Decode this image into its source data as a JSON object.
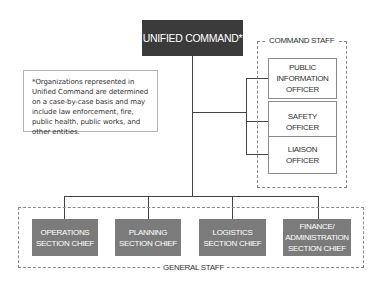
{
  "diagram": {
    "top": {
      "label": "UNIFIED COMMAND*"
    },
    "footnote": "*Organizations represented in Unified Command are determined on a case-by-case basis and may include law enforcement, fire, public health, public works, and other entities.",
    "command_staff": {
      "label": "COMMAND STAFF",
      "officers": [
        {
          "label": "PUBLIC\nINFORMATION\nOFFICER"
        },
        {
          "label": "SAFETY\nOFFICER"
        },
        {
          "label": "LIAISON\nOFFICER"
        }
      ]
    },
    "general_staff": {
      "label": "GENERAL STAFF",
      "chiefs": [
        {
          "label": "OPERATIONS\nSECTION CHIEF"
        },
        {
          "label": "PLANNING\nSECTION CHIEF"
        },
        {
          "label": "LOGISTICS\nSECTION CHIEF"
        },
        {
          "label": "FINANCE/\nADMINISTRATION\nSECTION CHIEF"
        }
      ]
    },
    "colors": {
      "top_box": "#3b3b3b",
      "chief_box": "#7b7b7b",
      "connector": "#444444",
      "dashed_border": "#8a8a8a"
    }
  }
}
